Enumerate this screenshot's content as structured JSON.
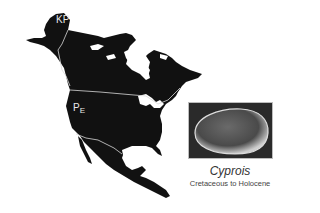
{
  "figure": {
    "map_region": "North America",
    "labels": {
      "kp": "KP",
      "pe_main": "P",
      "pe_sub": "E"
    },
    "inset": {
      "genus": "Cyprois",
      "range": "Cretaceous to Holocene"
    },
    "colors": {
      "land": "#111111",
      "background": "#ffffff",
      "boundary": "#d8d8d8",
      "photo_bg": "#2a2a2a"
    }
  }
}
